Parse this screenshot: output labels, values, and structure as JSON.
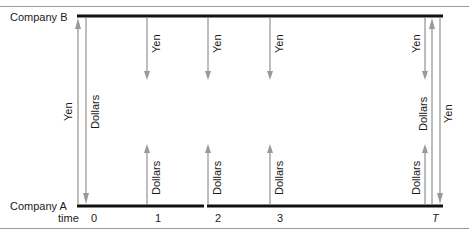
{
  "diagram": {
    "type": "currency-swap-cashflow",
    "parties": {
      "top": "Company B",
      "bottom": "Company A"
    },
    "time_axis": {
      "label": "time",
      "ticks": [
        "0",
        "1",
        "2",
        "3",
        "T"
      ]
    },
    "flows": [
      {
        "time": "0",
        "currency": "Yen",
        "direction": "A to B",
        "length": "full"
      },
      {
        "time": "0",
        "currency": "Dollars",
        "direction": "B to A",
        "length": "full"
      },
      {
        "time": "1",
        "currency": "Yen",
        "direction": "B to A",
        "length": "short"
      },
      {
        "time": "1",
        "currency": "Dollars",
        "direction": "A to B",
        "length": "short"
      },
      {
        "time": "2",
        "currency": "Yen",
        "direction": "B to A",
        "length": "short"
      },
      {
        "time": "2",
        "currency": "Dollars",
        "direction": "A to B",
        "length": "short"
      },
      {
        "time": "3",
        "currency": "Yen",
        "direction": "B to A",
        "length": "short"
      },
      {
        "time": "3",
        "currency": "Dollars",
        "direction": "A to B",
        "length": "short"
      },
      {
        "time": "T",
        "currency": "Yen",
        "direction": "B to A",
        "length": "short"
      },
      {
        "time": "T",
        "currency": "Dollars",
        "direction": "A to B",
        "length": "short"
      },
      {
        "time": "T",
        "currency": "Dollars",
        "direction": "A to B",
        "length": "full"
      },
      {
        "time": "T",
        "currency": "Yen",
        "direction": "B to A",
        "length": "full"
      }
    ],
    "labels": {
      "yen": "Yen",
      "dollars": "Dollars"
    },
    "colors": {
      "timeline": "#111111",
      "arrow": "#9a9a9a",
      "rule": "#9a9a9a",
      "text": "#1a1a1a"
    }
  }
}
